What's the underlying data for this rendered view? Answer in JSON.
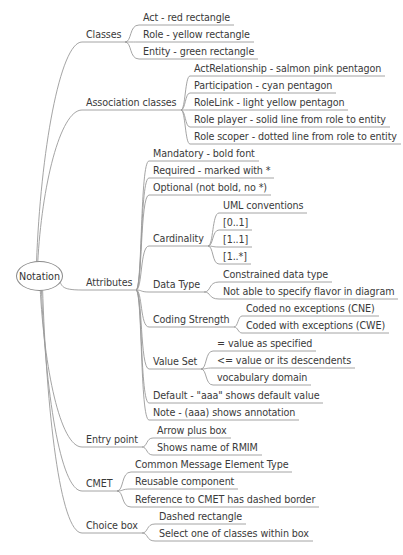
{
  "root": {
    "label": "Notation",
    "x": 16,
    "y": 261,
    "w": 45,
    "h": 28
  },
  "groups": [
    {
      "label": "Classes",
      "x": 86,
      "y": 29,
      "children": [
        {
          "label": "Act - red rectangle",
          "x": 143,
          "y": 12
        },
        {
          "label": "Role - yellow rectangle",
          "x": 143,
          "y": 29
        },
        {
          "label": "Entity - green rectangle",
          "x": 143,
          "y": 46
        }
      ]
    },
    {
      "label": "Association classes",
      "x": 86,
      "y": 97,
      "children": [
        {
          "label": "ActRelationship - salmon pink pentagon",
          "x": 194,
          "y": 63
        },
        {
          "label": "Participation - cyan pentagon",
          "x": 194,
          "y": 80
        },
        {
          "label": "RoleLink - light yellow pentagon",
          "x": 194,
          "y": 97
        },
        {
          "label": "Role player - solid line from role to entity",
          "x": 194,
          "y": 114
        },
        {
          "label": "Role scoper - dotted line from role to entity",
          "x": 194,
          "y": 131
        }
      ]
    },
    {
      "label": "Attributes",
      "x": 86,
      "y": 277,
      "children": [
        {
          "label": "Mandatory - bold font",
          "x": 153,
          "y": 148
        },
        {
          "label": "Required - marked with *",
          "x": 153,
          "y": 165
        },
        {
          "label": "Optional (not bold, no *)",
          "x": 153,
          "y": 182
        },
        {
          "label": "Cardinality",
          "x": 153,
          "y": 233,
          "children": [
            {
              "label": "UML conventions",
              "x": 223,
              "y": 200
            },
            {
              "label": "[0..1]",
              "x": 223,
              "y": 217
            },
            {
              "label": "[1..1]",
              "x": 223,
              "y": 234
            },
            {
              "label": "[1..*]",
              "x": 223,
              "y": 251
            }
          ]
        },
        {
          "label": "Data Type",
          "x": 153,
          "y": 279,
          "children": [
            {
              "label": "Constrained data type",
              "x": 223,
              "y": 269
            },
            {
              "label": "Not able to specify flavor in diagram",
              "x": 223,
              "y": 286
            }
          ]
        },
        {
          "label": "Coding Strength",
          "x": 153,
          "y": 314,
          "children": [
            {
              "label": "Coded no exceptions (CNE)",
              "x": 246,
              "y": 303
            },
            {
              "label": "Coded with exceptions (CWE)",
              "x": 246,
              "y": 320
            }
          ]
        },
        {
          "label": "Value Set",
          "x": 153,
          "y": 356,
          "children": [
            {
              "label": "= value as specified",
              "x": 217,
              "y": 338
            },
            {
              "label": "<= value or its descendents",
              "x": 217,
              "y": 355
            },
            {
              "label": "vocabulary domain",
              "x": 217,
              "y": 372
            }
          ]
        },
        {
          "label": "Default - \"aaa\" shows default value",
          "x": 153,
          "y": 390
        },
        {
          "label": "Note - (aaa) shows annotation",
          "x": 153,
          "y": 407
        }
      ]
    },
    {
      "label": "Entry point",
      "x": 86,
      "y": 434,
      "children": [
        {
          "label": "Arrow plus box",
          "x": 157,
          "y": 425
        },
        {
          "label": "Shows name of RMIM",
          "x": 157,
          "y": 442
        }
      ]
    },
    {
      "label": "CMET",
      "x": 86,
      "y": 478,
      "children": [
        {
          "label": "Common Message Element Type",
          "x": 135,
          "y": 459
        },
        {
          "label": "Reusable component",
          "x": 135,
          "y": 476
        },
        {
          "label": "Reference to CMET has dashed border",
          "x": 135,
          "y": 494
        }
      ]
    },
    {
      "label": "Choice box",
      "x": 86,
      "y": 520,
      "children": [
        {
          "label": "Dashed rectangle",
          "x": 159,
          "y": 511
        },
        {
          "label": "Select one of classes within box",
          "x": 159,
          "y": 528
        }
      ]
    }
  ],
  "colors": {
    "line": "#9a9a9a",
    "text": "#3a3a3a",
    "background": "#ffffff"
  }
}
